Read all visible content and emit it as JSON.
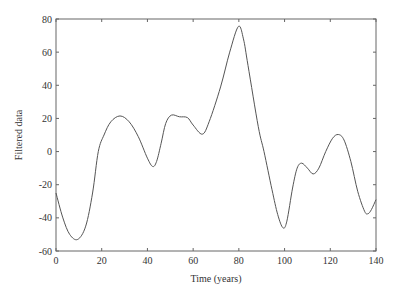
{
  "chart_data": {
    "type": "line",
    "title": "",
    "xlabel": "Time (years)",
    "ylabel": "Filtered data",
    "xlim": [
      0,
      140
    ],
    "ylim": [
      -60,
      80
    ],
    "xticks": [
      0,
      20,
      40,
      60,
      80,
      100,
      120,
      140
    ],
    "yticks": [
      -60,
      -40,
      -20,
      0,
      20,
      40,
      60,
      80
    ],
    "grid": false,
    "legend": null,
    "series": [
      {
        "name": "Filtered data",
        "color": "#555555",
        "x": [
          0,
          3,
          6,
          9.5,
          13,
          16,
          18.5,
          21,
          24,
          28,
          32,
          36,
          40,
          42.3,
          44,
          46,
          48,
          50.5,
          54,
          57.5,
          60,
          64,
          67,
          72,
          76,
          79.8,
          82,
          84,
          88.5,
          91,
          94.5,
          97,
          99.3,
          101,
          103.5,
          105.5,
          107.5,
          110,
          112.5,
          115,
          118,
          121,
          123.5,
          126,
          129,
          132,
          135,
          136.5,
          138,
          140
        ],
        "values": [
          -25,
          -40,
          -50,
          -53,
          -45,
          -25,
          0,
          10,
          18,
          21.5,
          18,
          9,
          -4,
          -9,
          -6,
          5,
          17,
          22,
          21,
          20.5,
          16,
          10.5,
          18,
          39,
          60,
          75.5,
          68,
          52,
          15,
          0,
          -23,
          -38,
          -46,
          -42,
          -22,
          -10,
          -7,
          -10,
          -13.5,
          -10,
          0,
          8,
          10.3,
          7,
          -6,
          -24,
          -36,
          -37.5,
          -35,
          -29
        ]
      }
    ]
  }
}
